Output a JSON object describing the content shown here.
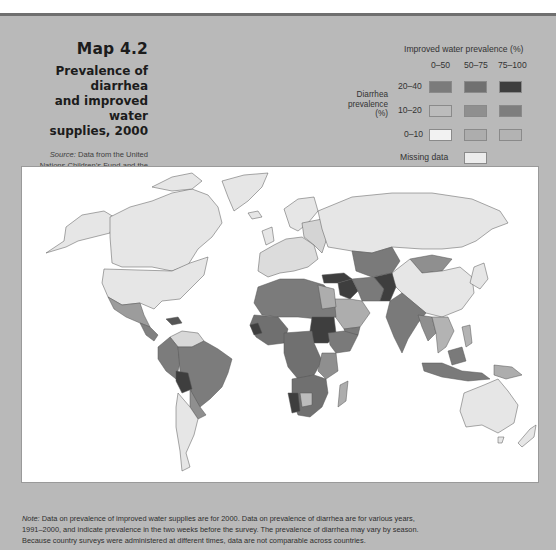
{
  "header": {
    "map_number": "Map 4.2",
    "title_line1": "Prevalence of diarrhea",
    "title_line2": "and improved water",
    "title_line3": "supplies, 2000",
    "source_label": "Source:",
    "source_line1": " Data from the United",
    "source_line2": "Nations Children’s Fund and the",
    "source_line3": "Joint Monitoring Programme."
  },
  "legend": {
    "title": "Improved water prevalence (%)",
    "axis_label_line1": "Diarrhea",
    "axis_label_line2": "prevalence",
    "axis_label_line3": "(%)",
    "columns": [
      "0–50",
      "50–75",
      "75–100"
    ],
    "rows": [
      "20–40",
      "10–20",
      "0–10"
    ],
    "colors": [
      [
        "#7b7b7b",
        "#707070",
        "#3e3e3e"
      ],
      [
        "#bcbcbc",
        "#8f8f8f",
        "#7e7e7e"
      ],
      [
        "#f2f2f2",
        "#adadad",
        "#b3b3b3"
      ]
    ],
    "missing_label": "Missing data",
    "missing_color": "#ececec"
  },
  "map": {
    "ocean_color": "#ffffff",
    "border_color": "#555555"
  },
  "note": {
    "label": "Note:",
    "line1": " Data on prevalence of improved water supplies are for 2000. Data on prevalence of diarrhea are for various years,",
    "line2": "1991–2000, and indicate prevalence in the two weeks before the survey. The prevalence of diarrhea may vary by season.",
    "line3": "Because country surveys were administered at different times, data are not comparable across countries."
  }
}
